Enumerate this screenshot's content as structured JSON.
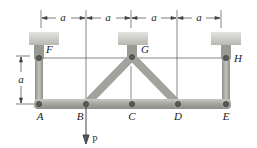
{
  "diagram": {
    "dimension_label": "a",
    "dimensions": [
      {
        "label": "a",
        "from": "F",
        "to": "B"
      },
      {
        "label": "a",
        "from": "B",
        "to": "G"
      },
      {
        "label": "a",
        "from": "G",
        "to": "D"
      },
      {
        "label": "a",
        "from": "D",
        "to": "H"
      }
    ],
    "vertical_dimension": {
      "label": "a",
      "from": "F",
      "to": "A"
    },
    "joints": {
      "A": "A",
      "B": "B",
      "C": "C",
      "D": "D",
      "E": "E",
      "F": "F",
      "G": "G",
      "H": "H"
    },
    "load": {
      "label": "P",
      "at": "B",
      "direction": "down"
    },
    "members": [
      "FA",
      "GB",
      "GD",
      "HE",
      "ABCDE"
    ],
    "colors": {
      "member": "#a9a9a3",
      "member_edge": "#7d7d78",
      "support": "#cfcfca",
      "line": "#333333",
      "pin": "#555555"
    }
  }
}
